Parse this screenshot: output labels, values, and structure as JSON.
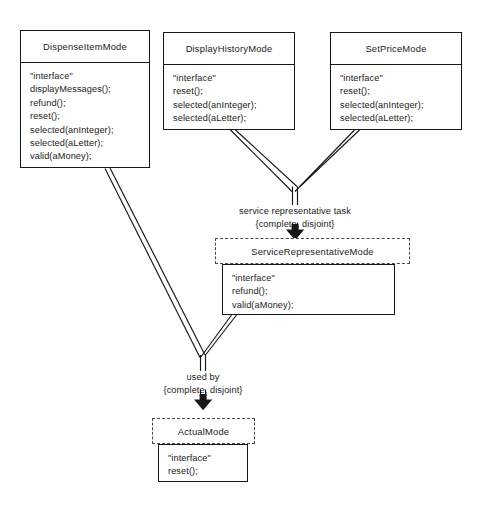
{
  "diagram": {
    "kind": "uml-class-diagram",
    "stereotype": "\"interface\"",
    "line_color": "#171717",
    "dashed_color": "#4a4a4a",
    "background": "#ffffff"
  },
  "classes": {
    "dispense_item_mode": {
      "name": "DispenseItemMode",
      "abstract": false,
      "operations": [
        "\"interface\"",
        "displayMessages();",
        "refund();",
        "reset();",
        "selected(anInteger);",
        "selected(aLetter);",
        "valid(aMoney);"
      ]
    },
    "display_history_mode": {
      "name": "DisplayHistoryMode",
      "abstract": false,
      "operations": [
        "\"interface\"",
        "reset();",
        "selected(anInteger);",
        "selected(aLetter);"
      ]
    },
    "set_price_mode": {
      "name": "SetPriceMode",
      "abstract": false,
      "operations": [
        "\"interface\"",
        "reset();",
        "selected(anInteger);",
        "selected(aLetter);"
      ]
    },
    "service_representative_mode": {
      "name": "ServiceRepresentativeMode",
      "abstract": true,
      "operations": [
        "\"interface\"",
        "refund();",
        "valid(aMoney);"
      ]
    },
    "actual_mode": {
      "name": "ActualMode",
      "abstract": true,
      "operations": [
        "\"interface\"",
        "reset();"
      ]
    }
  },
  "generalization_sets": [
    {
      "id": "service-representative-task",
      "name": "service representative task",
      "constraint": "{complete, disjoint}",
      "parent": "ServiceRepresentativeMode",
      "children": [
        "DisplayHistoryMode",
        "SetPriceMode"
      ]
    },
    {
      "id": "used-by",
      "name": "used by",
      "constraint": "{complete, disjoint}",
      "parent": "ActualMode",
      "children": [
        "DispenseItemMode",
        "ServiceRepresentativeMode"
      ]
    }
  ]
}
